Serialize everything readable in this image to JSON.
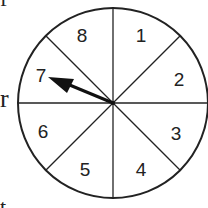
{
  "diagram": {
    "type": "spinner",
    "sections": [
      "1",
      "2",
      "3",
      "4",
      "5",
      "6",
      "7",
      "8"
    ],
    "section_count": 8,
    "arrow_points_to": "7",
    "side_text_fragments": {
      "left_middle": "r",
      "left_top": "f",
      "left_bottom": "t"
    }
  }
}
